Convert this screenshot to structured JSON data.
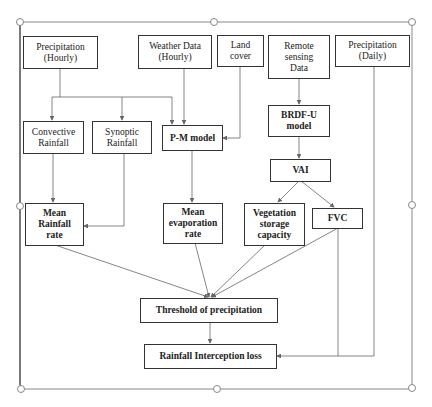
{
  "diagram": {
    "type": "flowchart",
    "nodes": {
      "precip_hourly": {
        "label": "Precipitation\n(Hourly)"
      },
      "weather_data": {
        "label": "Weather Data\n(Hourly)"
      },
      "land_cover": {
        "label": "Land\ncover"
      },
      "remote_sensing": {
        "label": "Remote\nsensing\nData"
      },
      "precip_daily": {
        "label": "Precipitation\n(Daily)"
      },
      "convective": {
        "label": "Convective\nRainfall"
      },
      "synoptic": {
        "label": "Synoptic\nRainfall"
      },
      "pm_model": {
        "label": "P-M model"
      },
      "brdf_u": {
        "label": "BRDF-U\nmodel"
      },
      "vai": {
        "label": "VAI"
      },
      "mean_rainfall": {
        "label": "Mean\nRainfall\nrate"
      },
      "mean_evaporation": {
        "label": "Mean\nevaporation\nrate"
      },
      "vegetation_storage": {
        "label": "Vegetation\nstorage\ncapacity"
      },
      "fvc": {
        "label": "FVC"
      },
      "threshold": {
        "label": "Threshold of precipitation"
      },
      "interception_loss": {
        "label": "Rainfall Interception loss"
      }
    },
    "edges": [
      [
        "precip_hourly",
        "convective"
      ],
      [
        "precip_hourly",
        "synoptic"
      ],
      [
        "precip_hourly",
        "pm_model"
      ],
      [
        "weather_data",
        "pm_model"
      ],
      [
        "land_cover",
        "pm_model"
      ],
      [
        "remote_sensing",
        "brdf_u"
      ],
      [
        "brdf_u",
        "vai"
      ],
      [
        "vai",
        "vegetation_storage"
      ],
      [
        "vai",
        "fvc"
      ],
      [
        "convective",
        "mean_rainfall"
      ],
      [
        "synoptic",
        "mean_rainfall"
      ],
      [
        "pm_model",
        "mean_evaporation"
      ],
      [
        "mean_rainfall",
        "threshold"
      ],
      [
        "mean_evaporation",
        "threshold"
      ],
      [
        "vegetation_storage",
        "threshold"
      ],
      [
        "fvc",
        "threshold"
      ],
      [
        "fvc",
        "interception_loss"
      ],
      [
        "precip_daily",
        "interception_loss"
      ],
      [
        "threshold",
        "interception_loss"
      ]
    ]
  },
  "colors": {
    "box_border": "#333333",
    "connector": "#666666",
    "frame": "#888888"
  }
}
